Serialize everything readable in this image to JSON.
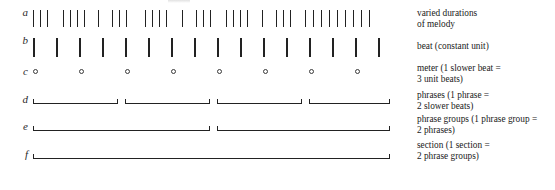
{
  "figure": {
    "rows": [
      {
        "id": "a",
        "label": "a",
        "kind": "ticks",
        "caption_lines": [
          "varied durations",
          "of melody"
        ],
        "caption_y": 8,
        "row_y": 10,
        "ticks": [
          33,
          40,
          47,
          63,
          70,
          77,
          84,
          98,
          112,
          119,
          126,
          145,
          152,
          159,
          166,
          182,
          196,
          203,
          210,
          226,
          233,
          240,
          247,
          262,
          276,
          283,
          290,
          305,
          313,
          321,
          329,
          337,
          345,
          353,
          361,
          369
        ]
      },
      {
        "id": "b",
        "label": "b",
        "kind": "ticks",
        "caption_lines": [
          "beat (constant unit)"
        ],
        "caption_y": 41,
        "row_y": 38,
        "ticks": [
          33,
          56,
          79,
          102,
          125,
          148,
          171,
          194,
          217,
          240,
          263,
          286,
          309,
          332,
          355,
          378
        ]
      },
      {
        "id": "c",
        "label": "c",
        "kind": "circles",
        "caption_lines": [
          "meter (1 slower beat =",
          "3 unit beats)"
        ],
        "caption_y": 63,
        "row_y": 69,
        "circles": [
          33,
          79,
          125,
          171,
          217,
          263,
          309,
          355
        ]
      },
      {
        "id": "d",
        "label": "d",
        "kind": "brackets",
        "caption_lines": [
          "phrases (1 phrase =",
          "2 slower beats)"
        ],
        "caption_y": 90,
        "row_y": 97,
        "brackets": [
          {
            "x": 33,
            "w": 85
          },
          {
            "x": 125,
            "w": 85
          },
          {
            "x": 217,
            "w": 85
          },
          {
            "x": 309,
            "w": 81
          }
        ]
      },
      {
        "id": "e",
        "label": "e",
        "kind": "brackets",
        "caption_lines": [
          "phrase groups (1 phrase group =",
          "2 phrases)"
        ],
        "caption_y": 114,
        "row_y": 124,
        "brackets": [
          {
            "x": 33,
            "w": 177
          },
          {
            "x": 217,
            "w": 173
          }
        ]
      },
      {
        "id": "f",
        "label": "f",
        "kind": "brackets",
        "caption_lines": [
          "section (1 section =",
          "2 phrase groups)"
        ],
        "caption_y": 140,
        "row_y": 152,
        "brackets": [
          {
            "x": 33,
            "w": 357
          }
        ]
      }
    ]
  },
  "colors": {
    "ink": "#222222",
    "paper": "#ffffff",
    "label_ink": "#2a2a2a"
  }
}
